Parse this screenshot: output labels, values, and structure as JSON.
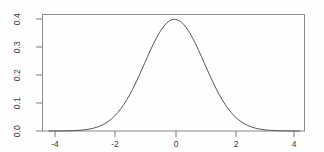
{
  "chart_data": {
    "type": "line",
    "title": "",
    "subtitle": "",
    "xlabel": "",
    "ylabel": "",
    "xlim": [
      -4.2,
      4.2
    ],
    "ylim": [
      0.0,
      0.42
    ],
    "grid": false,
    "legend": null,
    "annotations": [],
    "series": [
      {
        "name": "Standard normal density",
        "color": "#555555",
        "linewidth": 1,
        "x": [
          -4.2,
          -4.0,
          -3.8,
          -3.6,
          -3.4,
          -3.2,
          -3.0,
          -2.8,
          -2.6,
          -2.4,
          -2.2,
          -2.0,
          -1.8,
          -1.6,
          -1.4,
          -1.2,
          -1.0,
          -0.8,
          -0.6,
          -0.4,
          -0.2,
          0.0,
          0.2,
          0.4,
          0.6,
          0.8,
          1.0,
          1.2,
          1.4,
          1.6,
          1.8,
          2.0,
          2.2,
          2.4,
          2.6,
          2.8,
          3.0,
          3.2,
          3.4,
          3.6,
          3.8,
          4.0,
          4.2
        ],
        "y": [
          0.0001,
          0.0001,
          0.0003,
          0.0006,
          0.0012,
          0.0024,
          0.0044,
          0.0079,
          0.0136,
          0.0224,
          0.0355,
          0.054,
          0.079,
          0.1109,
          0.1497,
          0.1942,
          0.242,
          0.2897,
          0.3332,
          0.3683,
          0.391,
          0.3989,
          0.391,
          0.3683,
          0.3332,
          0.2897,
          0.242,
          0.1942,
          0.1497,
          0.1109,
          0.079,
          0.054,
          0.0355,
          0.0224,
          0.0136,
          0.0079,
          0.0044,
          0.0024,
          0.0012,
          0.0006,
          0.0003,
          0.0001,
          0.0001
        ]
      }
    ],
    "x_ticks": [
      {
        "value": -4,
        "label": "-4"
      },
      {
        "value": -2,
        "label": "-2"
      },
      {
        "value": 0,
        "label": "0"
      },
      {
        "value": 2,
        "label": "2"
      },
      {
        "value": 4,
        "label": "4"
      }
    ],
    "y_ticks": [
      {
        "value": 0.0,
        "label": "0.0"
      },
      {
        "value": 0.1,
        "label": "0.1"
      },
      {
        "value": 0.2,
        "label": "0.2"
      },
      {
        "value": 0.3,
        "label": "0.3"
      },
      {
        "value": 0.4,
        "label": "0.4"
      }
    ]
  },
  "axis_labels": {
    "x": [
      "-4",
      "-2",
      "0",
      "2",
      "4"
    ],
    "y": [
      "0.0",
      "0.1",
      "0.2",
      "0.3",
      "0.4"
    ]
  },
  "colors": {
    "background": "#ffffff",
    "plot_border": "#8a8a8a",
    "curve": "#555555",
    "tick": "#7a7a7a",
    "text": "#3a3a3a"
  }
}
